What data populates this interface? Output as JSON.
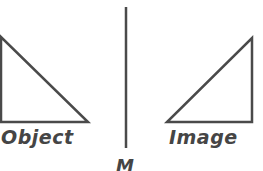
{
  "diagram": {
    "colors": {
      "stroke": "#4a4a4a",
      "text": "#454545",
      "background": "#ffffff"
    },
    "object": {
      "label": "Object",
      "shape": "right-triangle",
      "vertices": [
        [
          0,
          37
        ],
        [
          0,
          122
        ],
        [
          88,
          122
        ]
      ]
    },
    "image": {
      "label": "Image",
      "shape": "right-triangle",
      "vertices": [
        [
          252,
          38
        ],
        [
          252,
          122
        ],
        [
          167,
          122
        ]
      ]
    },
    "mirror": {
      "label": "M",
      "line": {
        "x": 126,
        "y1": 7,
        "y2": 148
      }
    }
  }
}
